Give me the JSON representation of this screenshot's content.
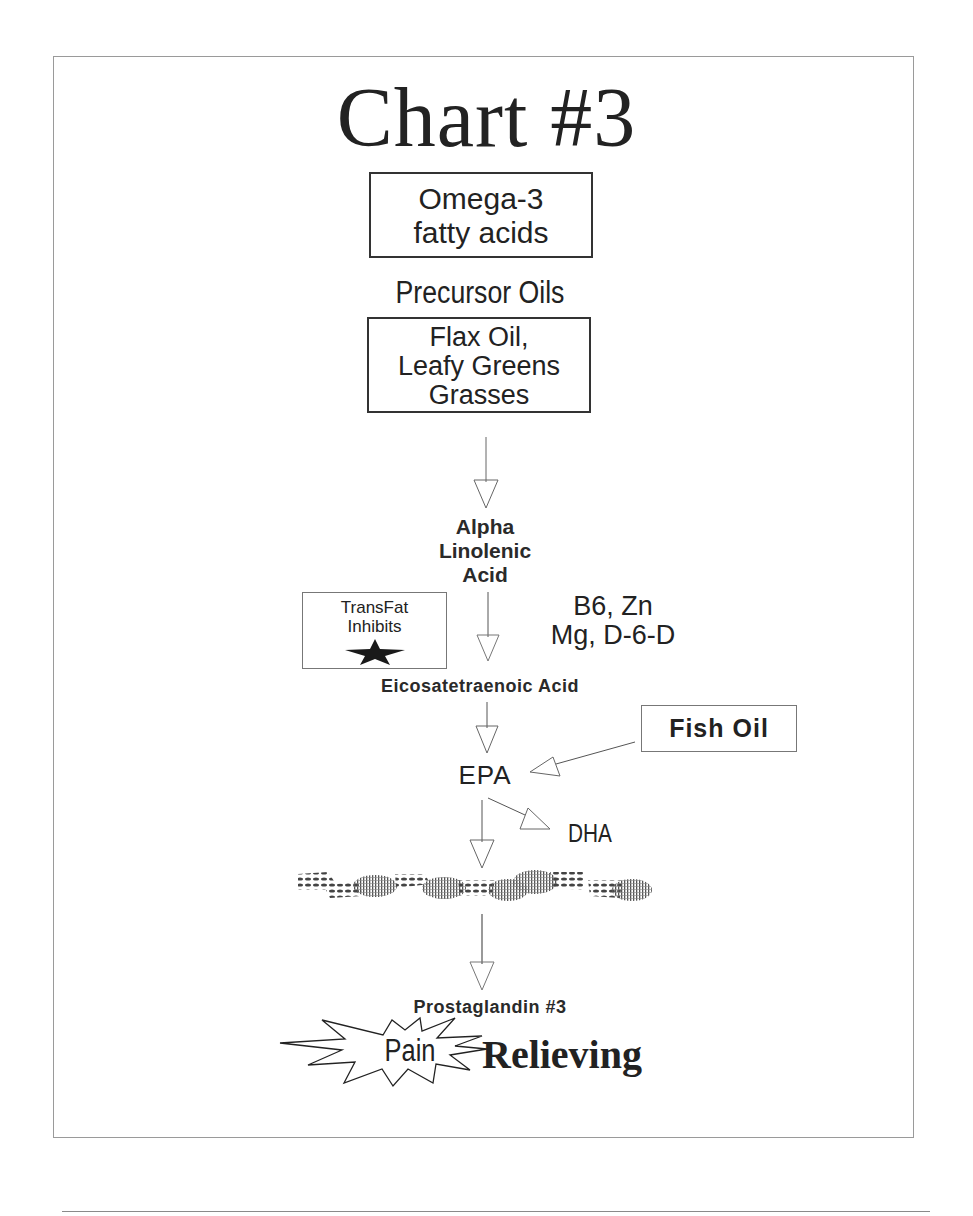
{
  "title": "Chart #3",
  "source_box": {
    "lines": [
      "Omega-3",
      "fatty acids"
    ]
  },
  "precursor": {
    "label": "Precursor Oils",
    "lines": [
      "Flax Oil,",
      "Leafy Greens",
      "Grasses"
    ]
  },
  "steps": {
    "ala": [
      "Alpha",
      "Linolenic",
      "Acid"
    ],
    "cofactors": [
      "B6, Zn",
      "Mg, D-6-D"
    ],
    "inhibitor": {
      "lines": [
        "TransFat",
        "Inhibits"
      ],
      "icon": "star-icon"
    },
    "eta": "Eicosatetraenoic Acid",
    "fish_oil": "Fish Oil",
    "epa": "EPA",
    "dha": "DHA",
    "prostaglandin": "Prostaglandin #3",
    "pain": "Pain",
    "relieving": "Relieving"
  },
  "colors": {
    "ink": "#222222",
    "frame": "#9a9a9a",
    "arrow": "#555555",
    "background": "#ffffff"
  }
}
